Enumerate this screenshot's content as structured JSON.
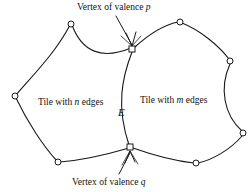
{
  "figure": {
    "width": 249,
    "height": 192,
    "background": "#ffffff",
    "stroke_color": "#1a1a1a",
    "vertex_fill": "#ffffff"
  },
  "labels": {
    "valence_p": {
      "prefix": "Vertex of valence ",
      "symbol": "p",
      "full": "Vertex of valence p"
    },
    "valence_q": {
      "prefix": "Vertex of valence ",
      "symbol": "q",
      "full": "Vertex of valence q"
    },
    "tile_n": {
      "prefix": "Tile with ",
      "symbol": "n",
      "suffix": " edges",
      "full": "Tile with n edges"
    },
    "tile_m": {
      "prefix": "Tile with ",
      "symbol": "m",
      "suffix": " edges",
      "full": "Tile with m edges"
    },
    "shared_edge": {
      "symbol": "E",
      "full": "E"
    }
  },
  "diagram_data": {
    "type": "planar-tiling-fragment",
    "description": "Two adjacent tiles of a tiling sharing a common curved edge E, joining a vertex of valence p at the top and a vertex of valence q at the bottom.",
    "tiles": [
      {
        "name": "tile-n",
        "label": "Tile with n edges",
        "edge_count_symbol": "n",
        "side": "left"
      },
      {
        "name": "tile-m",
        "label": "Tile with m edges",
        "edge_count_symbol": "m",
        "side": "right"
      }
    ],
    "shared_edge": {
      "name": "edge-E",
      "label": "E",
      "endpoints": [
        "vertex-p",
        "vertex-q"
      ]
    },
    "vertices": [
      {
        "name": "vertex-p",
        "shape": "square",
        "x": 132,
        "y": 49,
        "valence_symbol": "p",
        "annotated": true
      },
      {
        "name": "vertex-q",
        "shape": "square",
        "x": 130,
        "y": 147,
        "valence_symbol": "q",
        "annotated": true
      },
      {
        "name": "vertex-n-top",
        "shape": "circle",
        "x": 71,
        "y": 24,
        "annotated": false
      },
      {
        "name": "vertex-n-left",
        "shape": "circle",
        "x": 15,
        "y": 96,
        "annotated": false
      },
      {
        "name": "vertex-n-bottom",
        "shape": "circle",
        "x": 58,
        "y": 162,
        "annotated": false
      },
      {
        "name": "vertex-m-top",
        "shape": "circle",
        "x": 180,
        "y": 22,
        "annotated": false
      },
      {
        "name": "vertex-m-right-upper",
        "shape": "circle",
        "x": 230,
        "y": 61,
        "annotated": false
      },
      {
        "name": "vertex-m-right-lower",
        "shape": "circle",
        "x": 243,
        "y": 133,
        "annotated": false
      },
      {
        "name": "vertex-m-bottom",
        "shape": "circle",
        "x": 196,
        "y": 163,
        "annotated": false
      }
    ],
    "annotations": [
      {
        "name": "leader-to-vertex-p",
        "from": [
          116,
          17
        ],
        "to": [
          133,
          46
        ],
        "style": "arrow"
      },
      {
        "name": "leader-to-vertex-q",
        "from": [
          120,
          174
        ],
        "to": [
          131,
          152
        ],
        "style": "arrow"
      }
    ]
  }
}
